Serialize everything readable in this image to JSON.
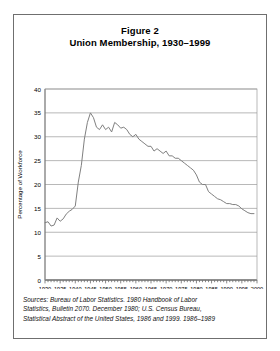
{
  "figure": {
    "title_line1": "Figure 2",
    "title_line2": "Union Membership, 1930–1999"
  },
  "sources": {
    "line1": "Sources: Bureau of Labor Statistics. 1980 Handbook of Labor",
    "line2": "Statistics, Bulletin 2070. December 1980; U.S. Census Bureau,",
    "line3": "Statistical Abstract of the United States, 1986 and 1999. 1986–1989"
  },
  "axis": {
    "y_label": "Percentage of Workforce",
    "x_label": "Year",
    "y_ticks": [
      "0",
      "5",
      "10",
      "15",
      "20",
      "25",
      "30",
      "35",
      "40"
    ],
    "x_ticks": [
      "1930",
      "1935",
      "1940",
      "1945",
      "1950",
      "1955",
      "1960",
      "1965",
      "1970",
      "1975",
      "1980",
      "1985",
      "1990",
      "1995",
      "2000"
    ]
  },
  "colors": {
    "line": "#808080",
    "grid": "#9a9a9a",
    "axis": "#555555",
    "border": "#6f6f6f",
    "text": "#000000"
  },
  "chart_data": {
    "type": "line",
    "xlabel": "Year",
    "ylabel": "Percentage of Workforce",
    "xlim": [
      1930,
      2000
    ],
    "ylim": [
      0,
      40
    ],
    "grid": true,
    "legend": "none",
    "x": [
      1930,
      1931,
      1932,
      1933,
      1934,
      1935,
      1936,
      1937,
      1938,
      1939,
      1940,
      1941,
      1942,
      1943,
      1944,
      1945,
      1946,
      1947,
      1948,
      1949,
      1950,
      1951,
      1952,
      1953,
      1954,
      1955,
      1956,
      1957,
      1958,
      1959,
      1960,
      1961,
      1962,
      1963,
      1964,
      1965,
      1966,
      1967,
      1968,
      1969,
      1970,
      1971,
      1972,
      1973,
      1974,
      1975,
      1976,
      1977,
      1978,
      1979,
      1980,
      1981,
      1982,
      1983,
      1984,
      1985,
      1986,
      1987,
      1988,
      1989,
      1990,
      1991,
      1992,
      1993,
      1994,
      1995,
      1996,
      1997,
      1998,
      1999
    ],
    "values": [
      12.0,
      12.2,
      11.3,
      11.5,
      13.0,
      12.3,
      12.8,
      13.8,
      14.4,
      14.8,
      15.5,
      20.5,
      24.0,
      29.5,
      33.0,
      35.0,
      34.0,
      32.0,
      31.5,
      32.5,
      31.5,
      32.0,
      31.0,
      33.0,
      32.5,
      31.8,
      32.0,
      31.5,
      30.5,
      30.0,
      30.5,
      29.5,
      29.0,
      28.5,
      28.0,
      28.0,
      27.0,
      27.5,
      27.0,
      26.5,
      27.0,
      26.0,
      26.0,
      25.5,
      25.5,
      25.0,
      24.5,
      24.0,
      23.5,
      23.0,
      22.0,
      20.5,
      20.0,
      20.0,
      18.5,
      18.0,
      17.5,
      17.0,
      16.8,
      16.4,
      16.0,
      16.0,
      15.8,
      15.8,
      15.5,
      14.9,
      14.5,
      14.1,
      13.9,
      13.9
    ]
  }
}
